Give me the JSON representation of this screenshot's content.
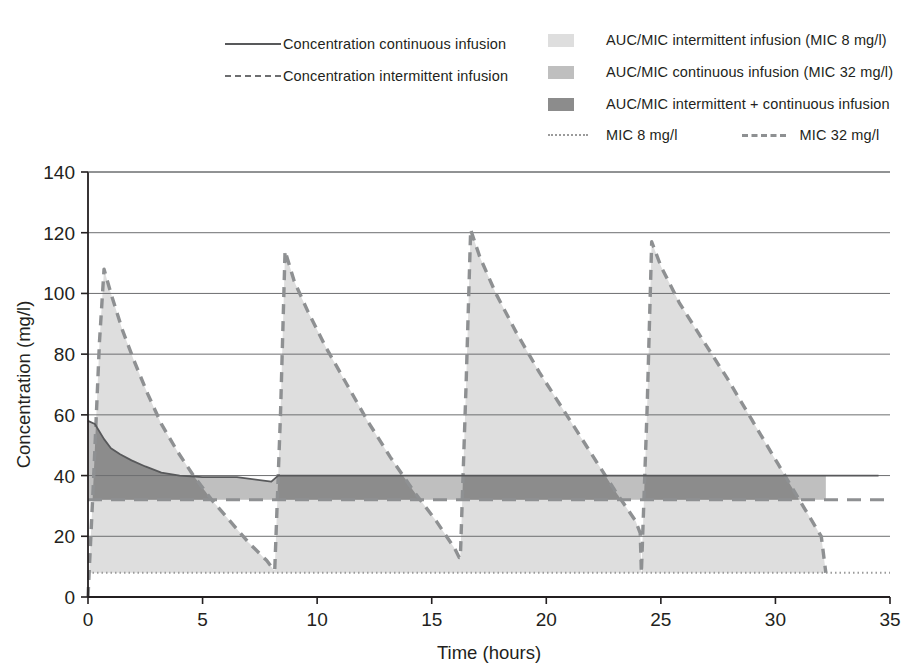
{
  "legend": {
    "left_items": [
      {
        "key": "solid-line",
        "label": "Concentration continuous infusion"
      },
      {
        "key": "dashed-line",
        "label": "Concentration intermittent infusion"
      }
    ],
    "right_items": [
      {
        "key": "swatch-light",
        "label": "AUC/MIC intermittent infusion (MIC 8 mg/l)",
        "color": "#dedede"
      },
      {
        "key": "swatch-medium",
        "label": "AUC/MIC continuous infusion (MIC 32 mg/l)",
        "color": "#bfbfbf"
      },
      {
        "key": "swatch-dark",
        "label": "AUC/MIC intermittent + continuous infusion",
        "color": "#8c8c8c"
      }
    ],
    "mic_items": [
      {
        "key": "dotted-line",
        "label": "MIC 8 mg/l",
        "color": "#9b9b9b"
      },
      {
        "key": "dashed-line",
        "label": "MIC 32 mg/l",
        "color": "#8e9092"
      }
    ]
  },
  "chart_data": {
    "type": "area",
    "title": "",
    "xlabel": "Time (hours)",
    "ylabel": "Concentration (mg/l)",
    "xlim": [
      0,
      35
    ],
    "ylim": [
      0,
      140
    ],
    "xticks": [
      0,
      5,
      10,
      15,
      20,
      25,
      30,
      35
    ],
    "yticks": [
      0,
      20,
      40,
      60,
      80,
      100,
      120,
      140
    ],
    "grid": "horizontal",
    "legend_position": "top",
    "colors": {
      "fill_intermittent": "#dedede",
      "fill_continuous": "#bfbfbf",
      "fill_overlap": "#8c8c8c",
      "line_continuous": "#58595b",
      "line_intermittent": "#8e9092",
      "mic8": "#9b9b9b",
      "mic32": "#8e9092",
      "axis": "#231f20",
      "grid": "#6d6e70"
    },
    "reference_lines": [
      {
        "name": "MIC 8 mg/l",
        "value": 8,
        "style": "dotted"
      },
      {
        "name": "MIC 32 mg/l",
        "value": 32,
        "style": "dashed"
      }
    ],
    "series": [
      {
        "name": "Concentration intermittent infusion",
        "style": "dashed",
        "x": [
          0.0,
          0.25,
          0.5,
          0.7,
          1.0,
          1.5,
          2.0,
          2.6,
          3.2,
          3.9,
          4.6,
          5.4,
          6.2,
          7.0,
          7.8,
          8.1,
          8.15,
          8.4,
          8.6,
          9.0,
          9.6,
          10.4,
          11.3,
          12.2,
          13.2,
          14.2,
          15.2,
          16.0,
          16.2,
          16.25,
          16.5,
          16.7,
          17.1,
          17.8,
          18.7,
          19.7,
          20.8,
          21.9,
          23.0,
          23.9,
          24.1,
          24.15,
          24.4,
          24.6,
          25.0,
          25.8,
          26.8,
          27.9,
          29.0,
          30.1,
          31.2,
          32.0,
          32.2
        ],
        "y": [
          0,
          40,
          84,
          108,
          100,
          88,
          78,
          67,
          57,
          48,
          40,
          32,
          25,
          18,
          12,
          9,
          9,
          60,
          114,
          104,
          94,
          82,
          70,
          58,
          46,
          35,
          25,
          16,
          13,
          13,
          70,
          121,
          112,
          100,
          87,
          74,
          61,
          48,
          35,
          25,
          21,
          8,
          62,
          117,
          109,
          97,
          85,
          72,
          58,
          44,
          30,
          20,
          8
        ]
      },
      {
        "name": "Concentration continuous infusion",
        "style": "solid",
        "x": [
          0.0,
          0.3,
          0.7,
          1.0,
          1.4,
          1.9,
          2.5,
          3.2,
          4.0,
          5.0,
          6.5,
          8.0,
          8.3,
          10.0,
          13.0,
          16.0,
          16.3,
          20.0,
          24.0,
          24.3,
          28.0,
          32.0,
          34.5
        ],
        "y": [
          58,
          57,
          52,
          49,
          47,
          45,
          43,
          41,
          40,
          39.5,
          39.5,
          38,
          40,
          40,
          40,
          40,
          40,
          40,
          40,
          40,
          40,
          40,
          40
        ]
      }
    ],
    "fills": {
      "intermittent_note": "area under intermittent curve down to MIC 8 baseline — light gray",
      "continuous_note": "band between MIC 32 and continuous concentration — medium gray",
      "overlap_note": "where both shaded regions coincide — dark gray"
    }
  },
  "axis": {
    "ylabel": "Concentration (mg/l)",
    "xlabel": "Time (hours)"
  }
}
